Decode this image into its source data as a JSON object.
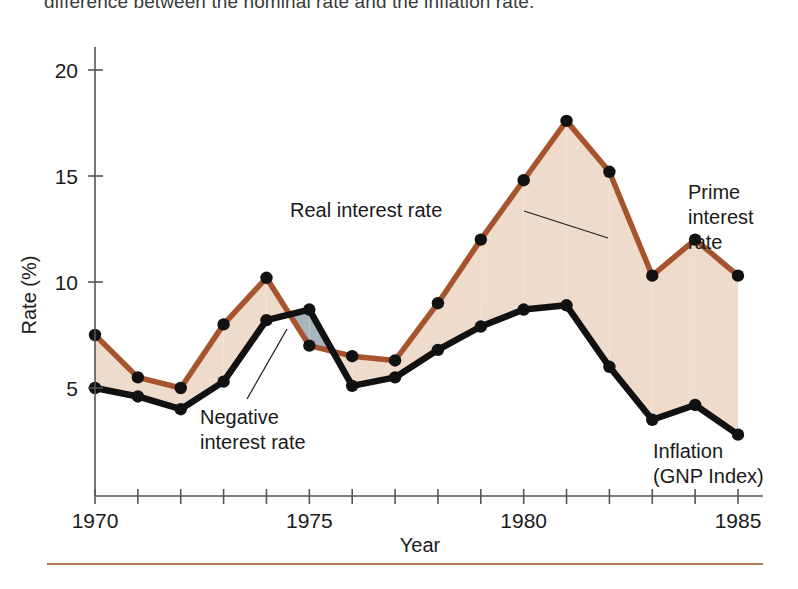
{
  "caption": {
    "top_text": "difference between the nominal rate and the inflation rate."
  },
  "axes": {
    "y_title": "Rate (%)",
    "x_title": "Year",
    "y_ticks": [
      "20",
      "15",
      "10",
      "5"
    ],
    "y_tick_values": [
      20,
      15,
      10,
      5
    ],
    "x_ticks": [
      "1970",
      "1975",
      "1980",
      "1985"
    ],
    "x_tick_values": [
      1970,
      1975,
      1980,
      1985
    ]
  },
  "annotations": {
    "real_interest_rate": "Real interest rate",
    "negative_interest_rate_line1": "Negative",
    "negative_interest_rate_line2": "interest rate",
    "prime_line1": "Prime",
    "prime_line2": "interest",
    "prime_line3": "rate",
    "inflation_line1": "Inflation",
    "inflation_line2": "(GNP Index)"
  },
  "colors": {
    "prime_line": "#A5542E",
    "inflation_line": "#111111",
    "positive_fill": "#EFDBCB",
    "negative_fill": "#A9B5BD",
    "axis": "#555555",
    "rule": "#B07A56"
  },
  "chart_data": {
    "type": "line",
    "title": "",
    "xlabel": "Year",
    "ylabel": "Rate (%)",
    "xlim": [
      1970,
      1985
    ],
    "ylim": [
      0,
      21
    ],
    "grid": false,
    "legend_position": "inline-annotations",
    "x": [
      1970,
      1971,
      1972,
      1973,
      1974,
      1975,
      1976,
      1977,
      1978,
      1979,
      1980,
      1981,
      1982,
      1983,
      1984,
      1985
    ],
    "series": [
      {
        "name": "Prime interest rate",
        "color": "#A5542E",
        "values": [
          7.5,
          5.5,
          5.0,
          8.0,
          10.2,
          7.0,
          6.5,
          6.3,
          9.0,
          12.0,
          14.8,
          17.6,
          15.2,
          10.3,
          12.0,
          10.3
        ]
      },
      {
        "name": "Inflation (GNP Index)",
        "color": "#111111",
        "values": [
          5.0,
          4.6,
          4.0,
          5.3,
          8.2,
          8.7,
          5.1,
          5.5,
          6.8,
          7.9,
          8.7,
          8.9,
          6.0,
          3.5,
          4.2,
          2.8
        ]
      }
    ],
    "fill_between": {
      "positive_label": "Real interest rate",
      "positive_color": "#EFDBCB",
      "negative_label": "Negative interest rate",
      "negative_color": "#A9B5BD"
    }
  }
}
